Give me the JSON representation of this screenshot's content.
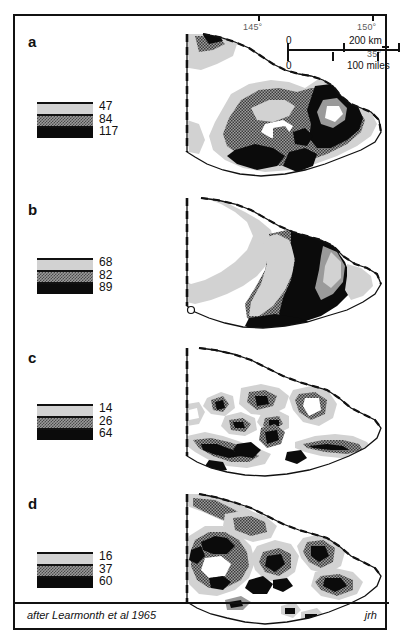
{
  "figure": {
    "source_note": "after Learmonth et al 1965",
    "initials": "jrh"
  },
  "graticule": {
    "lon_145": "145°",
    "lon_150": "150°",
    "lat_35": "35°"
  },
  "scalebar": {
    "km_zero": "0",
    "km_max": "200 km",
    "miles_zero": "0",
    "miles_max": "100 miles"
  },
  "panels": [
    {
      "label": "a",
      "legend_values": [
        "47",
        "84",
        "117"
      ]
    },
    {
      "label": "b",
      "legend_values": [
        "68",
        "82",
        "89"
      ]
    },
    {
      "label": "c",
      "legend_values": [
        "14",
        "26",
        "64"
      ]
    },
    {
      "label": "d",
      "legend_values": [
        "16",
        "37",
        "60"
      ]
    }
  ],
  "colors": {
    "ink": "#111111",
    "band_light": "#d2d2d2",
    "band_mid": "#9a9a9a",
    "band_dark": "#0b0b0b",
    "graticule_text": "#5d5d5d"
  }
}
